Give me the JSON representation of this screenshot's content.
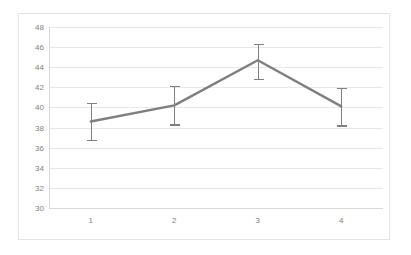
{
  "chart_data": {
    "type": "line",
    "title": "",
    "subtitle": "",
    "xlabel": "",
    "ylabel": "",
    "categories": [
      "1",
      "2",
      "3",
      "4"
    ],
    "x_tick_labels": [
      "1",
      "2",
      "3",
      "4"
    ],
    "y_tick_labels": [
      "30",
      "32",
      "34",
      "36",
      "38",
      "40",
      "42",
      "44",
      "46",
      "48"
    ],
    "y_ticks": [
      30,
      32,
      34,
      36,
      38,
      40,
      42,
      44,
      46,
      48
    ],
    "ylim": [
      30,
      48
    ],
    "grid": "horizontal",
    "legend": "none",
    "series": [
      {
        "name": "series-1",
        "color": "#7f7f7f",
        "values": [
          38.6,
          40.2,
          44.7,
          40.1
        ],
        "error_low": [
          36.8,
          38.3,
          42.8,
          38.2
        ],
        "error_high": [
          40.4,
          42.1,
          46.3,
          41.9
        ],
        "error_bars": [
          1.8,
          1.9,
          1.9,
          1.9
        ]
      }
    ],
    "colors": {
      "line": "#7f7f7f",
      "error_bar": "#808080",
      "gridline": "#e8e8e8",
      "axis": "#d9d9d9",
      "tick_text": "#7f7f7f",
      "plot_background": "#ffffff",
      "frame_border": "#e3e3e3",
      "page_background": "#ffffff"
    }
  }
}
